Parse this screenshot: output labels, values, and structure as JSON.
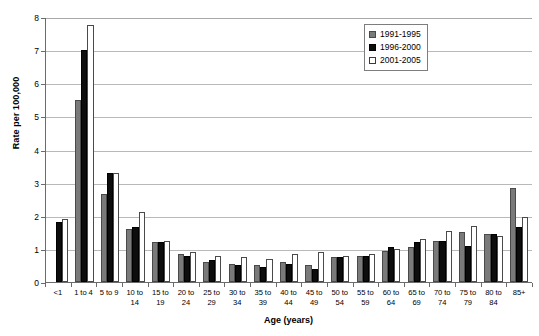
{
  "chart_data": {
    "type": "bar",
    "title": "",
    "xlabel": "Age (years)",
    "ylabel": "Rate per 100,000",
    "ylim": [
      0,
      8
    ],
    "ytick_labels": [
      "0",
      "1",
      "2",
      "3",
      "4",
      "5",
      "6",
      "7",
      "8"
    ],
    "grid": true,
    "legend_position": "top-right",
    "categories": [
      "<1",
      "1 to 4",
      "5 to 9",
      "10 to\n14",
      "15 to\n19",
      "20 to\n24",
      "25 to\n29",
      "30 to\n34",
      "35 to\n39",
      "40 to\n44",
      "45 to\n49",
      "50 to\n54",
      "55 to\n59",
      "60 to\n64",
      "65 to\n69",
      "70 to\n74",
      "75 to\n79",
      "80 to\n84",
      "85+"
    ],
    "series": [
      {
        "name": "1991-1995",
        "color": "#7a7a7a",
        "values": [
          0,
          5.5,
          2.65,
          1.6,
          1.2,
          0.85,
          0.6,
          0.55,
          0.5,
          0.6,
          0.5,
          0.75,
          0.8,
          0.95,
          1.05,
          1.25,
          1.5,
          1.45,
          2.85
        ]
      },
      {
        "name": "1996-2000",
        "color": "#0d0d0d",
        "values": [
          1.8,
          7.0,
          3.3,
          1.65,
          1.2,
          0.8,
          0.65,
          0.5,
          0.45,
          0.55,
          0.4,
          0.75,
          0.8,
          1.05,
          1.2,
          1.25,
          1.1,
          1.45,
          1.65
        ]
      },
      {
        "name": "2001-2005",
        "color": "#ffffff",
        "values": [
          1.9,
          7.75,
          3.3,
          2.1,
          1.25,
          0.9,
          0.8,
          0.75,
          0.7,
          0.85,
          0.9,
          0.8,
          0.85,
          1.0,
          1.3,
          1.55,
          1.7,
          1.4,
          1.95
        ]
      }
    ]
  }
}
